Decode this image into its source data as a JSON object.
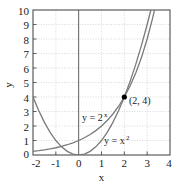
{
  "chart_data": {
    "type": "line",
    "title": "",
    "xlabel": "x",
    "ylabel": "y",
    "xlim": [
      -2,
      4
    ],
    "ylim": [
      0,
      10
    ],
    "xticks": [
      "-2",
      "-1",
      "0",
      "1",
      "2",
      "3",
      "4"
    ],
    "xtick_values": [
      -2,
      -1,
      0,
      1,
      2,
      3,
      4
    ],
    "yticks": [
      "0",
      "1",
      "2",
      "3",
      "4",
      "5",
      "6",
      "7",
      "8",
      "9",
      "10"
    ],
    "ytick_values": [
      0,
      1,
      2,
      3,
      4,
      5,
      6,
      7,
      8,
      9,
      10
    ],
    "grid": true,
    "legend": "none",
    "series": [
      {
        "name": "y = 2^x",
        "label_text": "y = 2",
        "label_sup": "x",
        "color": "#7a7a7a",
        "x": [
          -2,
          -1.75,
          -1.5,
          -1.25,
          -1,
          -0.75,
          -0.5,
          -0.25,
          0,
          0.25,
          0.5,
          0.75,
          1,
          1.25,
          1.5,
          1.75,
          2,
          2.25,
          2.5,
          2.75,
          3,
          3.25,
          3.32
        ],
        "values": [
          0.25,
          0.297,
          0.354,
          0.42,
          0.5,
          0.595,
          0.707,
          0.841,
          1,
          1.189,
          1.414,
          1.682,
          2,
          2.378,
          2.828,
          3.364,
          4,
          4.757,
          5.657,
          6.727,
          8,
          9.514,
          10
        ]
      },
      {
        "name": "y = x^2",
        "label_text": "y = x",
        "label_sup": "2",
        "color": "#7a7a7a",
        "x": [
          -2,
          -1.75,
          -1.5,
          -1.25,
          -1,
          -0.75,
          -0.5,
          -0.25,
          0,
          0.25,
          0.5,
          0.75,
          1,
          1.25,
          1.5,
          1.75,
          2,
          2.25,
          2.5,
          2.75,
          3,
          3.1623
        ],
        "values": [
          4,
          3.063,
          2.25,
          1.563,
          1,
          0.563,
          0.25,
          0.063,
          0,
          0.063,
          0.25,
          0.563,
          1,
          1.563,
          2.25,
          3.063,
          4,
          5.063,
          6.25,
          7.563,
          9,
          10
        ]
      }
    ],
    "annotations": [
      {
        "name": "intersection-point",
        "text": "(2, 4)",
        "x": 2,
        "y": 4,
        "marker": "filled-circle",
        "marker_color": "#000000"
      }
    ]
  },
  "colors": {
    "curve": "#7a7a7a",
    "axis": "#4d4d4d",
    "grid": "#c8c8c8",
    "background": "#ffffff",
    "text": "#1a1a1a"
  }
}
